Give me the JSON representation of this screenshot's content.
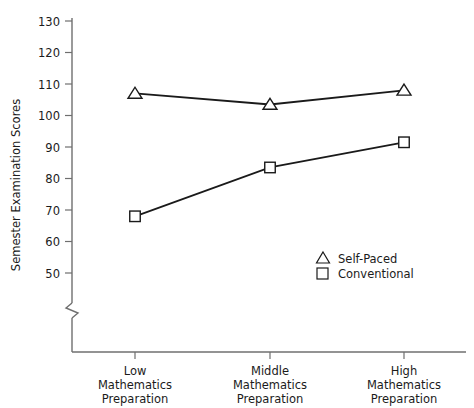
{
  "chart_data": {
    "type": "line",
    "title": "",
    "xlabel": "",
    "ylabel": "Semester Examination Scores",
    "categories": [
      "Low\nMathematics\nPreparation",
      "Middle\nMathematics\nPreparation",
      "High\nMathematics\nPreparation"
    ],
    "category_lines": [
      [
        "Low",
        "Mathematics",
        "Preparation"
      ],
      [
        "Middle",
        "Mathematics",
        "Preparation"
      ],
      [
        "High",
        "Mathematics",
        "Preparation"
      ]
    ],
    "series": [
      {
        "name": "Self-Paced",
        "marker": "triangle",
        "values": [
          107,
          103.5,
          108
        ]
      },
      {
        "name": "Conventional",
        "marker": "square",
        "values": [
          68,
          83.5,
          91.5
        ]
      }
    ],
    "ylim": [
      50,
      130
    ],
    "yticks": [
      50,
      60,
      70,
      80,
      90,
      100,
      110,
      120,
      130
    ],
    "ytick_labels": [
      "50",
      "60",
      "70",
      "80",
      "90",
      "100",
      "110",
      "120",
      "130"
    ],
    "axis_break": true,
    "grid": false,
    "legend_position": "inside-lower-right"
  },
  "yaxis": {
    "title": "Semester Examination Scores",
    "ticks": [
      "130",
      "120",
      "110",
      "100",
      "90",
      "80",
      "70",
      "60",
      "50"
    ]
  },
  "xaxis": {
    "categories": [
      {
        "line1": "Low",
        "line2": "Mathematics",
        "line3": "Preparation"
      },
      {
        "line1": "Middle",
        "line2": "Mathematics",
        "line3": "Preparation"
      },
      {
        "line1": "High",
        "line2": "Mathematics",
        "line3": "Preparation"
      }
    ]
  },
  "legend": {
    "items": [
      {
        "label": "Self-Paced",
        "marker": "triangle"
      },
      {
        "label": "Conventional",
        "marker": "square"
      }
    ]
  },
  "colors": {
    "line": "#1a1a1a",
    "axis": "#6f6f6f",
    "text": "#1b1b1b",
    "background": "#ffffff"
  }
}
